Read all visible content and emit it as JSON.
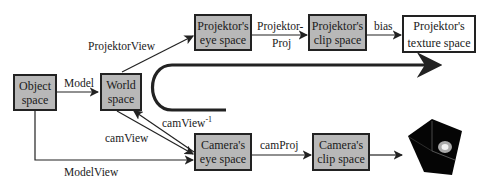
{
  "nodes": {
    "object_space": {
      "line1": "Object",
      "line2": "space"
    },
    "world_space": {
      "line1": "World",
      "line2": "space"
    },
    "projektor_eye": {
      "line1": "Projektor's",
      "line2": "eye space"
    },
    "projektor_clip": {
      "line1": "Projektor's",
      "line2": "clip space"
    },
    "projektor_texture": {
      "line1": "Projektor's",
      "line2": "texture space"
    },
    "camera_eye": {
      "line1": "Camera's",
      "line2": "eye space"
    },
    "camera_clip": {
      "line1": "Camera's",
      "line2": "clip space"
    }
  },
  "edges": {
    "model": "Model",
    "projektor_view": "ProjektorView",
    "projektor_proj_1": "Projektor-",
    "projektor_proj_2": "Proj",
    "bias": "bias",
    "cam_view_inverse": "camView",
    "cam_view_inverse_exp": "-1",
    "cam_view": "camView",
    "cam_proj": "camProj",
    "model_view": "ModelView"
  },
  "colors": {
    "box_fill": "#b8b8b8",
    "stroke": "#222222"
  }
}
